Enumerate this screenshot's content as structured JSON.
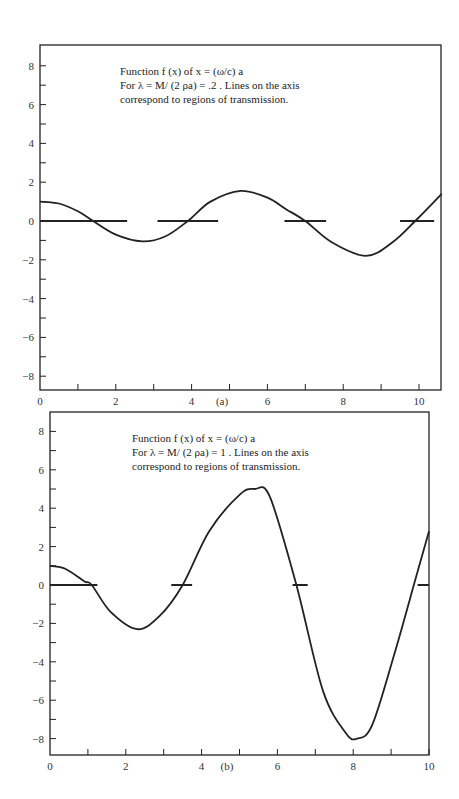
{
  "chart_data": [
    {
      "type": "line",
      "panel_label": "(a)",
      "annotation": [
        "Function f (x) of x = (ω/c) a",
        "For λ = M/ (2 ρa) = .2 .  Lines on the axis",
        "correspond to regions of transmission."
      ],
      "xlabel": "",
      "ylabel": "",
      "xlim": [
        0,
        10.6
      ],
      "ylim": [
        -8.8,
        9
      ],
      "x_ticks": [
        0,
        2,
        4,
        6,
        8,
        10
      ],
      "x_minor_ticks": [
        1,
        3,
        5,
        7,
        9
      ],
      "y_ticks": [
        -8,
        -6,
        -4,
        -2,
        0,
        2,
        4,
        6,
        8
      ],
      "y_minor_ticks": [
        -7,
        -5,
        -3,
        -1,
        1,
        3,
        5,
        7
      ],
      "grid": false,
      "lambda": 0.2,
      "series": [
        {
          "name": "f(x)",
          "x": [
            0,
            0.5,
            1.0,
            1.4,
            2.0,
            2.7,
            3.3,
            3.9,
            4.5,
            5.3,
            6.0,
            6.5,
            7.0,
            7.7,
            8.6,
            9.3,
            9.9,
            10.6
          ],
          "y": [
            1.0,
            0.9,
            0.5,
            0.0,
            -0.7,
            -1.05,
            -0.8,
            0.0,
            1.0,
            1.55,
            1.2,
            0.6,
            0.0,
            -1.1,
            -1.8,
            -1.1,
            0.0,
            1.4
          ]
        }
      ],
      "transmission_regions": [
        [
          0,
          2.3
        ],
        [
          3.1,
          4.7
        ],
        [
          6.45,
          7.55
        ],
        [
          9.5,
          10.4
        ]
      ]
    },
    {
      "type": "line",
      "panel_label": "(b)",
      "annotation": [
        "Function f (x) of x = (ω/c) a",
        "For λ = M/ (2 ρa) = 1 .  Lines on the axis",
        "correspond to regions of transmission."
      ],
      "xlabel": "",
      "ylabel": "",
      "xlim": [
        0,
        10
      ],
      "ylim": [
        -8.9,
        9
      ],
      "x_ticks": [
        0,
        2,
        4,
        6,
        8,
        10
      ],
      "x_minor_ticks": [
        1,
        3,
        5,
        7,
        9
      ],
      "y_ticks": [
        -8,
        -6,
        -4,
        -2,
        0,
        2,
        4,
        6,
        8
      ],
      "y_minor_ticks": [
        -7,
        -5,
        -3,
        -1,
        1,
        3,
        5,
        7
      ],
      "grid": false,
      "lambda": 1,
      "series": [
        {
          "name": "f(x)",
          "x": [
            0,
            0.4,
            0.9,
            1.1,
            1.6,
            2.3,
            2.9,
            3.5,
            4.2,
            5.0,
            5.4,
            5.8,
            6.5,
            7.2,
            7.8,
            8.1,
            8.5,
            9.1,
            9.6,
            10.0
          ],
          "y": [
            1.0,
            0.85,
            0.2,
            0.0,
            -1.4,
            -2.3,
            -1.6,
            0.0,
            2.8,
            4.7,
            5.0,
            4.6,
            0.0,
            -5.5,
            -7.7,
            -8.0,
            -7.3,
            -3.5,
            0.0,
            2.8
          ]
        }
      ],
      "transmission_regions": [
        [
          0,
          1.25
        ],
        [
          3.2,
          3.75
        ],
        [
          6.4,
          6.8
        ],
        [
          9.7,
          10.0
        ]
      ]
    }
  ]
}
